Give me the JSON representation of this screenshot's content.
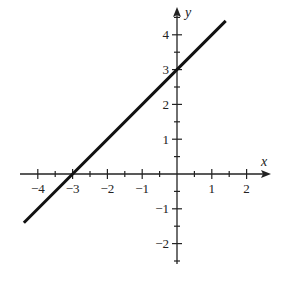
{
  "chart_data": {
    "type": "line",
    "title": "",
    "xlabel": "x",
    "ylabel": "y",
    "xlim": [
      -4.4,
      2.6
    ],
    "ylim": [
      -2.5,
      4.6
    ],
    "x_ticks": [
      -4,
      -3,
      -2,
      -1,
      1,
      2
    ],
    "y_ticks": [
      -2,
      -1,
      1,
      2,
      3,
      4
    ],
    "x_tick_labels": [
      "−4",
      "−3",
      "−2",
      "−1",
      "1",
      "2"
    ],
    "y_tick_labels": [
      "−2",
      "−1",
      "1",
      "2",
      "3",
      "4"
    ],
    "minor_ticks_step": 0.5,
    "grid": false,
    "series": [
      {
        "name": "y = x + 3",
        "x": [
          -4.4,
          1.4
        ],
        "y": [
          -1.4,
          4.4
        ],
        "color": "#111111"
      }
    ],
    "annotations": [
      "x-intercept at (-3, 0)",
      "y-intercept at (0, 3)"
    ]
  },
  "labels": {
    "x_axis": "x",
    "y_axis": "y"
  }
}
